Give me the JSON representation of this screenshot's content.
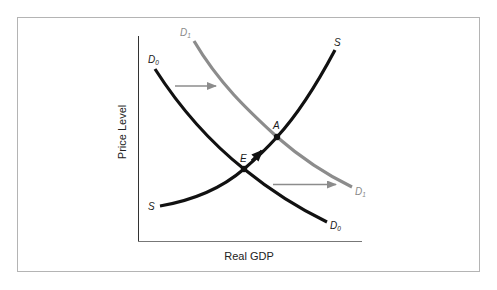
{
  "diagram": {
    "type": "aggregate-demand-supply-shift",
    "axes": {
      "x_label": "Real GDP",
      "y_label": "Price Level"
    },
    "curves": {
      "supply": {
        "label": "S",
        "label_end": "S",
        "color": "#111111"
      },
      "demand_initial": {
        "label": "D",
        "subscript": "0",
        "color": "#111111"
      },
      "demand_shifted": {
        "label": "D",
        "subscript": "1",
        "color": "#8c8c8c"
      }
    },
    "points": {
      "initial_equilibrium": {
        "label": "E"
      },
      "new_equilibrium": {
        "label": "A"
      }
    },
    "shift_arrows": {
      "color": "#8c8c8c",
      "count": 2,
      "direction": "right"
    },
    "movement_arrow": {
      "from": "E",
      "to": "A",
      "color": "#111111"
    },
    "colors": {
      "frame_border": "#b4b4b4",
      "axis": "#333333"
    }
  }
}
